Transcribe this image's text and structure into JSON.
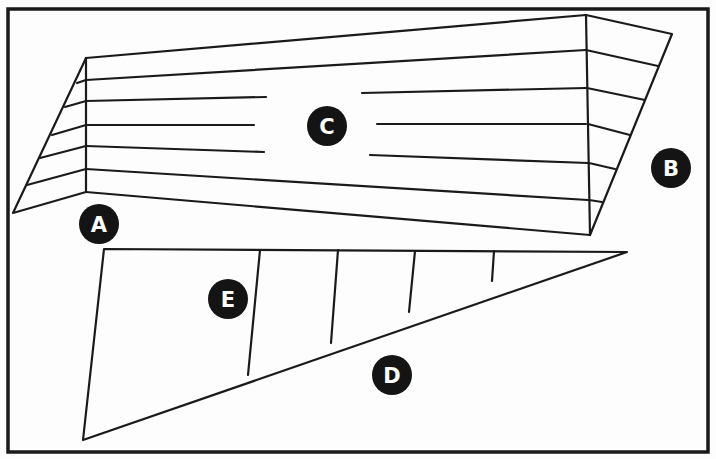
{
  "figure": {
    "labels": [
      {
        "id": "A",
        "text": "A",
        "refers_to": "left angled side panel"
      },
      {
        "id": "B",
        "text": "B",
        "refers_to": "right angled side panel"
      },
      {
        "id": "C",
        "text": "C",
        "refers_to": "center striped panel"
      },
      {
        "id": "D",
        "text": "D",
        "refers_to": "triangle long edge"
      },
      {
        "id": "E",
        "text": "E",
        "refers_to": "triangle divided into sections"
      }
    ],
    "colors": {
      "line": "#1a1a1a",
      "label_fill": "#141414",
      "label_text": "#ffffff",
      "background": "#fdfdfd"
    }
  }
}
